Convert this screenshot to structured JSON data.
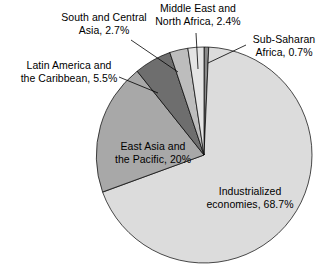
{
  "chart_data": {
    "type": "pie",
    "title": "",
    "subtitle": "",
    "xlabel": "",
    "ylabel": "",
    "legend_position": "none",
    "grid": false,
    "label_format": "name, percent",
    "start_angle_deg": 0,
    "direction": "clockwise",
    "categories": [
      "Sub-Saharan Africa",
      "Industrialized economies",
      "East Asia and the Pacific",
      "Latin America and the Caribbean",
      "South and Central Asia",
      "Middle East and North Africa"
    ],
    "values": [
      0.7,
      68.7,
      20,
      5.5,
      2.7,
      2.4
    ],
    "slices": [
      {
        "name": "Sub-Saharan Africa",
        "value": 0.7,
        "label": "Sub-Saharan\nAfrica, 0.7%",
        "color": "#8a8a8a",
        "label_placement": "outside"
      },
      {
        "name": "Industrialized economies",
        "value": 68.7,
        "label": "Industrialized\neconomies, 68.7%",
        "color": "#dcdcdc",
        "label_placement": "inside"
      },
      {
        "name": "East Asia and the Pacific",
        "value": 20,
        "label": "East Asia and\nthe Pacific, 20%",
        "color": "#a8a8a8",
        "label_placement": "inside"
      },
      {
        "name": "Latin America and the Caribbean",
        "value": 5.5,
        "label": "Latin America and\nthe Caribbean, 5.5%",
        "color": "#6e6e6e",
        "label_placement": "outside"
      },
      {
        "name": "South and Central Asia",
        "value": 2.7,
        "label": "South and Central\nAsia, 2.7%",
        "color": "#bdbdbd",
        "label_placement": "outside"
      },
      {
        "name": "Middle East and North Africa",
        "value": 2.4,
        "label": "Middle East and\nNorth Africa, 2.4%",
        "color": "#e4e4e4",
        "label_placement": "outside"
      }
    ]
  },
  "labels": {
    "south_central_asia": "South and Central\nAsia, 2.7%",
    "middle_east_north_africa": "Middle East and\nNorth Africa, 2.4%",
    "sub_saharan_africa": "Sub-Saharan\nAfrica, 0.7%",
    "latin_america_caribbean": "Latin America and\nthe Caribbean, 5.5%",
    "east_asia_pacific": "East Asia and\nthe Pacific, 20%",
    "industrialized_economies": "Industrialized\neconomies, 68.7%"
  },
  "colors": {
    "outline": "#000000",
    "leader_line": "#000000",
    "background": "#ffffff",
    "text": "#000000"
  }
}
